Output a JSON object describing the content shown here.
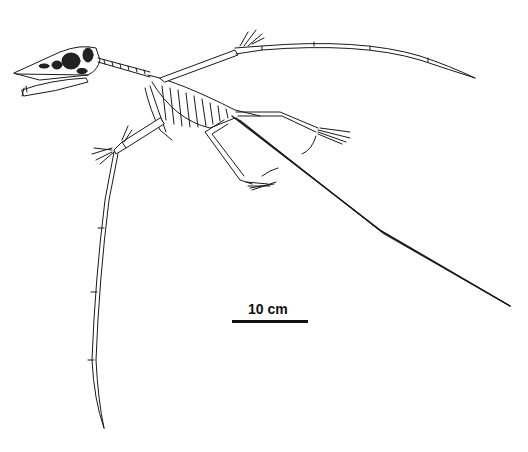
{
  "figure": {
    "style": "black line drawing on white background",
    "colors": {
      "line": "#1a1a1a",
      "fill_dark": "#222222",
      "background": "#ffffff"
    }
  },
  "scale_bar": {
    "label": "10 cm",
    "length_px": 76
  }
}
